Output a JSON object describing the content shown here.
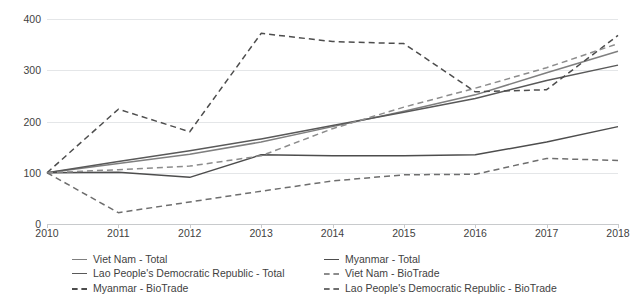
{
  "chart_data": {
    "type": "line",
    "title": "",
    "subtitle": "",
    "xlabel": "",
    "ylabel": "",
    "x": [
      2010,
      2011,
      2012,
      2013,
      2014,
      2015,
      2016,
      2017,
      2018
    ],
    "xtick_labels": [
      "2010",
      "2011",
      "2012",
      "2013",
      "2014",
      "2015",
      "2016",
      "2017",
      "2018"
    ],
    "ytick_labels": [
      "0",
      "100",
      "200",
      "300",
      "400"
    ],
    "ytick_values": [
      0,
      100,
      200,
      300,
      400
    ],
    "ylim": [
      0,
      400
    ],
    "xlim": [
      2010,
      2018
    ],
    "grid": true,
    "grid_axis": "y",
    "legend_position": "bottom",
    "legend_columns": 2,
    "series": [
      {
        "name": "Viet Nam - Total",
        "style": "solid",
        "color": "#7f7f7f",
        "values": [
          100,
          118,
          136,
          160,
          190,
          220,
          252,
          295,
          337
        ]
      },
      {
        "name": "Lao People's Democratic Republic - Total",
        "style": "solid",
        "color": "#595959",
        "values": [
          100,
          122,
          143,
          166,
          192,
          218,
          245,
          280,
          310
        ]
      },
      {
        "name": "Myanmar - BioTrade",
        "style": "dashed",
        "color": "#4d4d4d",
        "values": [
          100,
          224,
          180,
          372,
          356,
          352,
          258,
          262,
          368
        ]
      },
      {
        "name": "Myanmar - Total",
        "style": "solid",
        "color": "#4d4d4d",
        "values": [
          100,
          101,
          91,
          135,
          133,
          133,
          135,
          160,
          190
        ]
      },
      {
        "name": "Viet Nam - BioTrade",
        "style": "dashed",
        "color": "#8c8c8c",
        "values": [
          100,
          106,
          113,
          133,
          186,
          228,
          265,
          305,
          352
        ]
      },
      {
        "name": "Lao People's Democratic Republic - BioTrade",
        "style": "dashed",
        "color": "#6e6e6e",
        "values": [
          100,
          22,
          43,
          64,
          84,
          96,
          97,
          128,
          124
        ]
      }
    ],
    "legend_entries": [
      {
        "label": "Viet Nam - Total",
        "style": "solid",
        "color": "#7f7f7f",
        "column": "left"
      },
      {
        "label": "Lao People's Democratic Republic - Total",
        "style": "solid",
        "color": "#595959",
        "column": "left"
      },
      {
        "label": "Myanmar - BioTrade",
        "style": "dashed",
        "color": "#4d4d4d",
        "column": "left"
      },
      {
        "label": "Myanmar - Total",
        "style": "solid",
        "color": "#4d4d4d",
        "column": "right"
      },
      {
        "label": "Viet Nam - BioTrade",
        "style": "dashed",
        "color": "#8c8c8c",
        "column": "right"
      },
      {
        "label": "Lao People's Democratic Republic - BioTrade",
        "style": "dashed",
        "color": "#6e6e6e",
        "column": "right"
      }
    ],
    "colors": {
      "grid": "#e4e6e8",
      "axis": "#c8cacc",
      "text": "#3f3f3f",
      "background": "#ffffff"
    }
  }
}
